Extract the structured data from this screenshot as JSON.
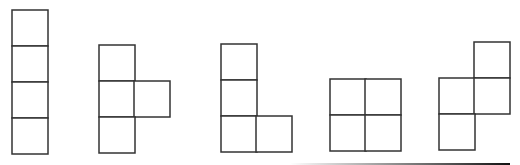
{
  "diagram": {
    "title": "",
    "cell_size": 36,
    "stroke_color": "#333333",
    "background": "#ffffff",
    "shapes": [
      {
        "name": "I-tetromino",
        "cells": [
          [
            12,
            10
          ],
          [
            12,
            46
          ],
          [
            12,
            82
          ],
          [
            12,
            118
          ]
        ]
      },
      {
        "name": "T-tetromino",
        "cells": [
          [
            99,
            45
          ],
          [
            99,
            81
          ],
          [
            134,
            81
          ],
          [
            99,
            117
          ]
        ]
      },
      {
        "name": "L-tetromino",
        "cells": [
          [
            221,
            44
          ],
          [
            221,
            80
          ],
          [
            221,
            116
          ],
          [
            256,
            116
          ]
        ]
      },
      {
        "name": "O-tetromino",
        "cells": [
          [
            330,
            79
          ],
          [
            365,
            79
          ],
          [
            330,
            115
          ],
          [
            365,
            115
          ]
        ]
      },
      {
        "name": "S-tetromino",
        "cells": [
          [
            474,
            42
          ],
          [
            439,
            78
          ],
          [
            474,
            78
          ],
          [
            439,
            114
          ]
        ]
      }
    ],
    "bottom_rule": {
      "x1": 290,
      "x2": 510,
      "y": 163
    }
  }
}
